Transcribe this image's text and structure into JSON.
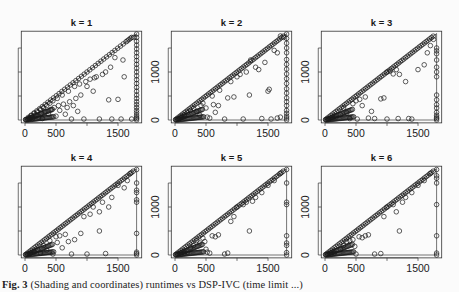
{
  "figure": {
    "caption_label": "Fig. 3",
    "caption_text": "(Shading and coordinates) runtimes vs DSP-IVC (time limit ...)",
    "ink_color": "#1a1a1a",
    "axis_color": "#333333",
    "background": "#fbfbfb"
  },
  "chart_data": [
    {
      "type": "scatter",
      "title": "k = 1",
      "xlabel": "",
      "ylabel": "",
      "xticks": [
        0,
        500,
        1500
      ],
      "yticks": [
        0,
        1000
      ],
      "xlim": [
        -60,
        1850
      ],
      "ylim": [
        -60,
        1850
      ],
      "diagonal": true,
      "timeout": 1800,
      "points": [
        [
          50,
          20
        ],
        [
          80,
          60
        ],
        [
          100,
          90
        ],
        [
          120,
          30
        ],
        [
          150,
          140
        ],
        [
          180,
          100
        ],
        [
          200,
          170
        ],
        [
          220,
          60
        ],
        [
          250,
          220
        ],
        [
          260,
          140
        ],
        [
          280,
          30
        ],
        [
          300,
          260
        ],
        [
          320,
          180
        ],
        [
          350,
          300
        ],
        [
          380,
          120
        ],
        [
          400,
          350
        ],
        [
          420,
          220
        ],
        [
          450,
          400
        ],
        [
          470,
          260
        ],
        [
          500,
          80
        ],
        [
          520,
          450
        ],
        [
          540,
          300
        ],
        [
          560,
          200
        ],
        [
          600,
          520
        ],
        [
          620,
          330
        ],
        [
          650,
          120
        ],
        [
          680,
          260
        ],
        [
          700,
          600
        ],
        [
          720,
          380
        ],
        [
          750,
          20
        ],
        [
          780,
          300
        ],
        [
          800,
          700
        ],
        [
          820,
          450
        ],
        [
          850,
          180
        ],
        [
          880,
          750
        ],
        [
          900,
          520
        ],
        [
          950,
          20
        ],
        [
          980,
          800
        ],
        [
          1000,
          700
        ],
        [
          1050,
          850
        ],
        [
          1100,
          600
        ],
        [
          1120,
          880
        ],
        [
          1150,
          900
        ],
        [
          1200,
          20
        ],
        [
          1250,
          950
        ],
        [
          1300,
          1000
        ],
        [
          1350,
          420
        ],
        [
          1380,
          1100
        ],
        [
          1400,
          20
        ],
        [
          1450,
          1300
        ],
        [
          1500,
          430
        ],
        [
          1550,
          20
        ],
        [
          1580,
          1250
        ],
        [
          1600,
          900
        ],
        [
          1650,
          1650
        ],
        [
          1700,
          1700
        ],
        [
          1750,
          1720
        ],
        [
          1720,
          20
        ]
      ],
      "timeout_ys": [
        0,
        30,
        60,
        100,
        150,
        200,
        260,
        320,
        380,
        450,
        520,
        600,
        680,
        760,
        840,
        920,
        1000,
        1080,
        1160,
        1240,
        1320,
        1400,
        1480,
        1560,
        1640,
        1720,
        1790
      ]
    },
    {
      "type": "scatter",
      "title": "k = 2",
      "xlabel": "",
      "ylabel": "",
      "xticks": [
        0,
        500,
        1500
      ],
      "yticks": [
        0,
        1000
      ],
      "xlim": [
        -60,
        1850
      ],
      "ylim": [
        -60,
        1850
      ],
      "diagonal": true,
      "timeout": 1800,
      "points": [
        [
          60,
          30
        ],
        [
          100,
          70
        ],
        [
          150,
          110
        ],
        [
          200,
          150
        ],
        [
          250,
          200
        ],
        [
          300,
          240
        ],
        [
          350,
          180
        ],
        [
          400,
          100
        ],
        [
          420,
          300
        ],
        [
          450,
          350
        ],
        [
          500,
          250
        ],
        [
          520,
          60
        ],
        [
          560,
          40
        ],
        [
          600,
          500
        ],
        [
          620,
          320
        ],
        [
          650,
          160
        ],
        [
          700,
          300
        ],
        [
          720,
          620
        ],
        [
          800,
          20
        ],
        [
          850,
          460
        ],
        [
          900,
          800
        ],
        [
          950,
          480
        ],
        [
          1000,
          900
        ],
        [
          1050,
          950
        ],
        [
          1100,
          20
        ],
        [
          1150,
          1000
        ],
        [
          1200,
          520
        ],
        [
          1220,
          1250
        ],
        [
          1300,
          1100
        ],
        [
          1350,
          1050
        ],
        [
          1400,
          30
        ],
        [
          1450,
          1200
        ],
        [
          1500,
          600
        ],
        [
          1520,
          640
        ],
        [
          1550,
          20
        ],
        [
          1600,
          1450
        ],
        [
          1650,
          1400
        ],
        [
          1700,
          1750
        ],
        [
          1750,
          1720
        ],
        [
          1650,
          40
        ],
        [
          1700,
          60
        ]
      ],
      "timeout_ys": [
        0,
        40,
        80,
        140,
        200,
        300,
        380,
        460,
        560,
        650,
        760,
        860,
        960,
        1060,
        1160,
        1260,
        1400,
        1500,
        1600,
        1700,
        1790
      ]
    },
    {
      "type": "scatter",
      "title": "k = 3",
      "xlabel": "",
      "ylabel": "",
      "xticks": [
        0,
        500,
        1500
      ],
      "yticks": [
        0,
        1000
      ],
      "xlim": [
        -60,
        1850
      ],
      "ylim": [
        -60,
        1850
      ],
      "diagonal": true,
      "timeout": 1800,
      "points": [
        [
          60,
          20
        ],
        [
          120,
          40
        ],
        [
          180,
          60
        ],
        [
          250,
          110
        ],
        [
          300,
          250
        ],
        [
          350,
          150
        ],
        [
          400,
          30
        ],
        [
          450,
          340
        ],
        [
          500,
          400
        ],
        [
          520,
          20
        ],
        [
          560,
          430
        ],
        [
          600,
          300
        ],
        [
          650,
          480
        ],
        [
          700,
          40
        ],
        [
          750,
          180
        ],
        [
          800,
          30
        ],
        [
          900,
          440
        ],
        [
          950,
          460
        ],
        [
          1000,
          20
        ],
        [
          1100,
          960
        ],
        [
          1150,
          1050
        ],
        [
          1180,
          30
        ],
        [
          1200,
          950
        ],
        [
          1300,
          800
        ],
        [
          1350,
          30
        ],
        [
          1400,
          20
        ],
        [
          1500,
          1050
        ],
        [
          1600,
          1150
        ],
        [
          1650,
          1400
        ],
        [
          1700,
          1550
        ],
        [
          1750,
          1680
        ],
        [
          1000,
          1000
        ],
        [
          1050,
          1020
        ]
      ],
      "timeout_ys": [
        0,
        30,
        60,
        100,
        160,
        250,
        320,
        420,
        520,
        900,
        1000,
        1100,
        1250,
        1380,
        1440,
        1500
      ]
    },
    {
      "type": "scatter",
      "title": "k = 4",
      "xlabel": "",
      "ylabel": "",
      "xticks": [
        0,
        500,
        1500
      ],
      "yticks": [
        0,
        1000
      ],
      "xlim": [
        -60,
        1850
      ],
      "ylim": [
        -60,
        1850
      ],
      "diagonal": true,
      "timeout": 1800,
      "points": [
        [
          80,
          30
        ],
        [
          150,
          60
        ],
        [
          200,
          120
        ],
        [
          250,
          40
        ],
        [
          300,
          200
        ],
        [
          350,
          100
        ],
        [
          400,
          300
        ],
        [
          450,
          20
        ],
        [
          500,
          380
        ],
        [
          520,
          260
        ],
        [
          560,
          400
        ],
        [
          600,
          150
        ],
        [
          650,
          430
        ],
        [
          700,
          280
        ],
        [
          750,
          20
        ],
        [
          800,
          320
        ],
        [
          900,
          450
        ],
        [
          950,
          800
        ],
        [
          1000,
          20
        ],
        [
          1050,
          850
        ],
        [
          1100,
          1000
        ],
        [
          1200,
          900
        ],
        [
          1250,
          1100
        ],
        [
          1300,
          30
        ],
        [
          1350,
          1000
        ],
        [
          1400,
          1200
        ],
        [
          1500,
          1450
        ],
        [
          1600,
          1400
        ],
        [
          1650,
          1550
        ],
        [
          1700,
          1700
        ],
        [
          1200,
          500
        ]
      ],
      "timeout_ys": [
        0,
        30,
        60,
        450,
        1100,
        1150,
        1300,
        1350,
        1500,
        1780
      ]
    },
    {
      "type": "scatter",
      "title": "k = 5",
      "xlabel": "",
      "ylabel": "",
      "xticks": [
        0,
        500,
        1500
      ],
      "yticks": [
        0,
        1000
      ],
      "xlim": [
        -60,
        1850
      ],
      "ylim": [
        -60,
        1850
      ],
      "diagonal": true,
      "timeout": 1800,
      "points": [
        [
          100,
          20
        ],
        [
          150,
          40
        ],
        [
          200,
          60
        ],
        [
          250,
          150
        ],
        [
          300,
          200
        ],
        [
          350,
          300
        ],
        [
          400,
          250
        ],
        [
          450,
          350
        ],
        [
          480,
          280
        ],
        [
          500,
          120
        ],
        [
          520,
          60
        ],
        [
          560,
          40
        ],
        [
          600,
          400
        ],
        [
          650,
          380
        ],
        [
          700,
          420
        ],
        [
          800,
          20
        ],
        [
          850,
          40
        ],
        [
          900,
          700
        ],
        [
          950,
          800
        ],
        [
          1000,
          1000
        ],
        [
          1100,
          1050
        ],
        [
          1150,
          1100
        ],
        [
          1200,
          500
        ],
        [
          1250,
          1120
        ],
        [
          1300,
          1200
        ],
        [
          1400,
          1300
        ],
        [
          1500,
          1450
        ],
        [
          1600,
          1550
        ],
        [
          1700,
          1700
        ]
      ],
      "timeout_ys": [
        0,
        50,
        200,
        250,
        400,
        1050,
        1100,
        1500,
        1780
      ]
    },
    {
      "type": "scatter",
      "title": "k = 6",
      "xlabel": "",
      "ylabel": "",
      "xticks": [
        0,
        500,
        1500
      ],
      "yticks": [
        0,
        1000
      ],
      "xlim": [
        -60,
        1850
      ],
      "ylim": [
        -60,
        1850
      ],
      "diagonal": true,
      "timeout": 1800,
      "points": [
        [
          100,
          20
        ],
        [
          150,
          40
        ],
        [
          250,
          120
        ],
        [
          300,
          200
        ],
        [
          350,
          280
        ],
        [
          400,
          300
        ],
        [
          450,
          320
        ],
        [
          480,
          180
        ],
        [
          500,
          20
        ],
        [
          550,
          380
        ],
        [
          600,
          360
        ],
        [
          650,
          400
        ],
        [
          700,
          420
        ],
        [
          800,
          20
        ],
        [
          900,
          30
        ],
        [
          950,
          800
        ],
        [
          1000,
          1000
        ],
        [
          1100,
          1050
        ],
        [
          1150,
          900
        ],
        [
          1200,
          500
        ],
        [
          1250,
          1100
        ],
        [
          1300,
          1200
        ],
        [
          1400,
          1300
        ],
        [
          1500,
          1450
        ],
        [
          1600,
          1550
        ],
        [
          1700,
          1700
        ]
      ],
      "timeout_ys": [
        0,
        40,
        400,
        1050,
        1500,
        1600,
        1650,
        1780
      ]
    }
  ]
}
